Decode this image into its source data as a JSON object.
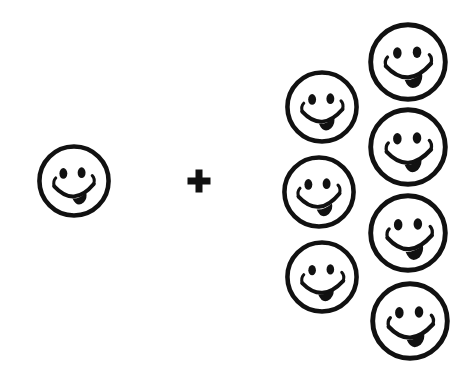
{
  "canvas": {
    "width": 472,
    "height": 371,
    "background_color": "#ffffff",
    "ink_color": "#111111"
  },
  "equation": {
    "description": "Pictorial addition problem drawn with smiley faces",
    "left_addend_count": 1,
    "operator_symbol": "+",
    "operator_name": "plus-sign",
    "right_addend_count": 7,
    "total_faces": 8
  },
  "left_group": {
    "name": "left-addend-group",
    "count": 1,
    "faces": [
      {
        "id": "face-left-1",
        "cx": 74,
        "cy": 181,
        "r": 36,
        "stroke": 4.6
      }
    ]
  },
  "operator": {
    "name": "plus-operator",
    "symbol": "+",
    "cx": 199,
    "cy": 181,
    "arm_length": 21,
    "arm_thickness": 7
  },
  "right_group": {
    "name": "right-addend-group",
    "count": 7,
    "columns": [
      {
        "name": "right-group-inner-column",
        "count": 3,
        "faces": [
          {
            "id": "face-right-a1",
            "cx": 322,
            "cy": 107,
            "r": 37,
            "stroke": 4.6
          },
          {
            "id": "face-right-a2",
            "cx": 319,
            "cy": 192,
            "r": 37,
            "stroke": 4.6
          },
          {
            "id": "face-right-a3",
            "cx": 322,
            "cy": 277,
            "r": 37,
            "stroke": 4.6
          }
        ]
      },
      {
        "name": "right-group-outer-column",
        "count": 4,
        "faces": [
          {
            "id": "face-right-b1",
            "cx": 408,
            "cy": 62,
            "r": 40,
            "stroke": 4.8
          },
          {
            "id": "face-right-b2",
            "cx": 408,
            "cy": 147,
            "r": 40,
            "stroke": 4.8
          },
          {
            "id": "face-right-b3",
            "cx": 408,
            "cy": 233,
            "r": 40,
            "stroke": 4.8
          },
          {
            "id": "face-right-b4",
            "cx": 410,
            "cy": 321,
            "r": 40,
            "stroke": 4.8
          }
        ]
      }
    ]
  },
  "face_features": {
    "eye_left_name": "left-eye",
    "eye_right_name": "right-eye",
    "mouth_name": "smile-mouth",
    "tongue_name": "tongue-blob",
    "cheek_left_name": "left-cheek-tick",
    "cheek_right_name": "right-cheek-tick"
  }
}
